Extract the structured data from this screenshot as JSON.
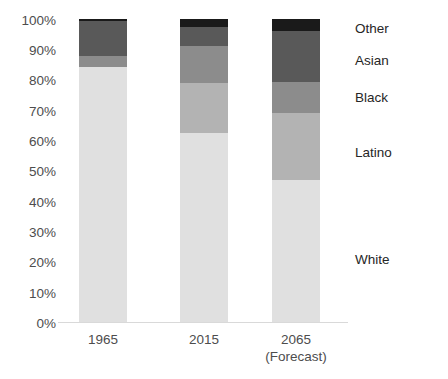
{
  "chart_data": {
    "type": "bar",
    "stacked": true,
    "normalized": true,
    "title": "Projected U.S. population by race/ethnicity (% of total)",
    "title_visible": false,
    "xlabel": "",
    "ylabel": "",
    "ylim": [
      0,
      100
    ],
    "ytick_labels": [
      "100%",
      "90%",
      "80%",
      "70%",
      "60%",
      "50%",
      "40%",
      "30%",
      "20%",
      "10%",
      "0%"
    ],
    "ytick_values": [
      100,
      90,
      80,
      70,
      60,
      50,
      40,
      30,
      20,
      10,
      0
    ],
    "grid": false,
    "legend_position": "right-inline",
    "categories": [
      "1965",
      "2015",
      "2065"
    ],
    "category_sublabels": [
      "",
      "",
      "(Forecast)"
    ],
    "series": [
      {
        "name": "White",
        "values": [
          84,
          62,
          46
        ],
        "color": "#e0e0e0"
      },
      {
        "name": "Latino",
        "values": [
          4,
          17,
          23
        ],
        "color": "#b3b3b3"
      },
      {
        "name": "Black",
        "values": [
          11,
          12,
          10
        ],
        "color": "#8c8c8c"
      },
      {
        "name": "Asian",
        "values": [
          0.5,
          6,
          17
        ],
        "color": "#595959"
      },
      {
        "name": "Other",
        "values": [
          0.5,
          3,
          4
        ],
        "color": "#1a1a1a"
      }
    ],
    "legend_entries": [
      "Other",
      "Asian",
      "Black",
      "Latino",
      "White"
    ],
    "legend_label_y": [
      28,
      60,
      97,
      152,
      259
    ],
    "segment_colors": {
      "white": "#e0e0e0",
      "latino": "#b3b3b3",
      "black": "#8c8c8c",
      "asian": "#595959",
      "other": "#1a1a1a"
    },
    "axis_color": "#d9d9d9",
    "text_color": "#4d4d4d"
  },
  "axis": {
    "ticks": [
      {
        "label": "100%",
        "top": 14
      },
      {
        "label": "90%",
        "top": 44
      },
      {
        "label": "80%",
        "top": 74
      },
      {
        "label": "70%",
        "top": 105
      },
      {
        "label": "60%",
        "top": 135
      },
      {
        "label": "50%",
        "top": 165
      },
      {
        "label": "40%",
        "top": 196
      },
      {
        "label": "30%",
        "top": 226
      },
      {
        "label": "20%",
        "top": 256
      },
      {
        "label": "10%",
        "top": 287
      },
      {
        "label": "0%",
        "top": 317
      }
    ]
  },
  "bars": {
    "b1965": {
      "category": "1965",
      "sublabel": "",
      "segments": [
        {
          "name": "Other",
          "pct": 0.5,
          "px": 2
        },
        {
          "name": "Asian",
          "pct": 11.5,
          "px": 35
        },
        {
          "name": "Black",
          "pct": 3.6,
          "px": 11
        },
        {
          "name": "White",
          "pct": 84.4,
          "px": 255
        }
      ]
    },
    "b2015": {
      "category": "2015",
      "sublabel": "",
      "segments": [
        {
          "name": "Other",
          "pct": 2.6,
          "px": 8
        },
        {
          "name": "Asian",
          "pct": 6.3,
          "px": 19
        },
        {
          "name": "Black",
          "pct": 12.2,
          "px": 37
        },
        {
          "name": "Latino",
          "pct": 16.5,
          "px": 50
        },
        {
          "name": "White",
          "pct": 62.4,
          "px": 189
        }
      ]
    },
    "b2065": {
      "category": "2065",
      "sublabel": "(Forecast)",
      "segments": [
        {
          "name": "Other",
          "pct": 4.0,
          "px": 12
        },
        {
          "name": "Asian",
          "pct": 16.8,
          "px": 51
        },
        {
          "name": "Black",
          "pct": 10.2,
          "px": 31
        },
        {
          "name": "Latino",
          "pct": 22.1,
          "px": 67
        },
        {
          "name": "White",
          "pct": 46.9,
          "px": 142
        }
      ]
    }
  },
  "legend": {
    "items": [
      {
        "label": "Other",
        "top": 22
      },
      {
        "label": "Asian",
        "top": 54
      },
      {
        "label": "Black",
        "top": 91
      },
      {
        "label": "Latino",
        "top": 146
      },
      {
        "label": "White",
        "top": 253
      }
    ]
  }
}
